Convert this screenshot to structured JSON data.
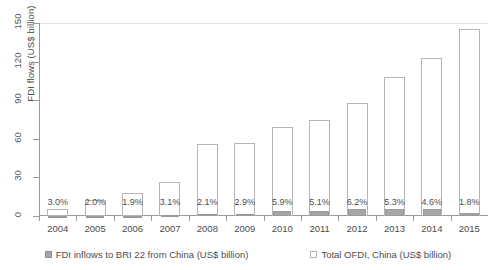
{
  "chart_data": {
    "type": "bar",
    "title": "",
    "subtitle": "",
    "xlabel": "",
    "ylabel": "FDI flows (US$ billion)",
    "categories": [
      "2004",
      "2005",
      "2006",
      "2007",
      "2008",
      "2009",
      "2010",
      "2011",
      "2012",
      "2013",
      "2014",
      "2015"
    ],
    "ylim": [
      0,
      150
    ],
    "yticks": [
      0,
      30,
      60,
      90,
      120,
      150
    ],
    "ytick_labels": [
      "0",
      "30",
      "60",
      "90",
      "120",
      "150"
    ],
    "grid": false,
    "legend_position": "bottom",
    "bar_style": "grouped-overlay",
    "series": [
      {
        "name": "FDI inflows to BRI 22 from China  (US$ billion)",
        "color": "#a6a6a6",
        "values": [
          0.17,
          0.24,
          0.33,
          0.82,
          1.18,
          1.64,
          4.07,
          3.77,
          5.46,
          5.72,
          5.66,
          2.63
        ]
      },
      {
        "name": "Total OFDI, China (US$ billion)",
        "color": "#ffffff",
        "values": [
          5.5,
          12.3,
          17.6,
          26.5,
          55.9,
          56.5,
          68.8,
          74.7,
          87.8,
          107.8,
          123.1,
          145.7
        ]
      }
    ],
    "data_labels": [
      "3.0%",
      "2.0%",
      "1.9%",
      "3.1%",
      "2.1%",
      "2.9%",
      "5.9%",
      "5.1%",
      "6.2%",
      "5.3%",
      "4.6%",
      "1.8%"
    ],
    "data_label_note": "BRI 22 share of China total OFDI"
  },
  "legend": {
    "items": [
      {
        "label": "FDI inflows to BRI 22 from China  (US$ billion)",
        "swatch": "gray"
      },
      {
        "label": "Total OFDI, China (US$ billion)",
        "swatch": "white"
      }
    ]
  }
}
